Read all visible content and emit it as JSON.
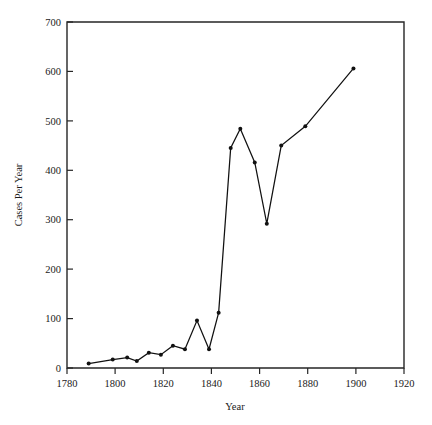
{
  "figure": {
    "faint_header_text": "",
    "background_color": "#ffffff",
    "line_color": "#111111",
    "axis_color": "#262626"
  },
  "chart_data": {
    "type": "line",
    "title": "",
    "xlabel": "Year",
    "ylabel": "Cases Per Year",
    "xlim": [
      1780,
      1920
    ],
    "ylim": [
      0,
      700
    ],
    "xticks": [
      1780,
      1800,
      1820,
      1840,
      1860,
      1880,
      1900,
      1920
    ],
    "yticks": [
      0,
      100,
      200,
      300,
      400,
      500,
      600,
      700
    ],
    "grid": false,
    "legend": false,
    "markers": true,
    "x": [
      1789,
      1799,
      1805,
      1809,
      1814,
      1819,
      1824,
      1829,
      1834,
      1839,
      1843,
      1848,
      1852,
      1858,
      1863,
      1869,
      1879,
      1899
    ],
    "y": [
      9,
      17,
      21,
      14,
      31,
      27,
      45,
      38,
      96,
      38,
      112,
      445,
      484,
      416,
      292,
      450,
      489,
      606
    ],
    "series": [
      {
        "name": "Cases Per Year",
        "x": [
          1789,
          1799,
          1805,
          1809,
          1814,
          1819,
          1824,
          1829,
          1834,
          1839,
          1843,
          1848,
          1852,
          1858,
          1863,
          1869,
          1879,
          1899
        ],
        "values": [
          9,
          17,
          21,
          14,
          31,
          27,
          45,
          38,
          96,
          38,
          112,
          445,
          484,
          416,
          292,
          450,
          489,
          606
        ]
      }
    ]
  }
}
